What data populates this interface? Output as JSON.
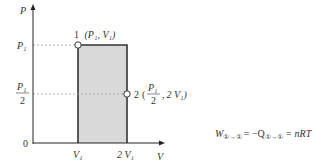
{
  "diagram": {
    "type": "pv-diagram",
    "axes": {
      "y_label": "P",
      "x_label": "V",
      "origin_label": "0",
      "y_ticks": [
        {
          "label": "P₁",
          "value": "P1"
        },
        {
          "label": "P₁/2",
          "numerator": "P₁",
          "denominator": "2",
          "value": "P1/2"
        }
      ],
      "x_ticks": [
        {
          "label": "V₁",
          "value": "V1"
        },
        {
          "label": "2 V₁",
          "value": "2V1"
        }
      ]
    },
    "points": [
      {
        "id": "1",
        "label": "1",
        "coords": "(P₁, V₁)",
        "P": "P1",
        "V": "V1"
      },
      {
        "id": "2",
        "label": "2",
        "coords_numerator": "P₁",
        "coords_denominator": "2",
        "coords_second": "2 V₁",
        "P": "P1/2",
        "V": "2V1"
      }
    ],
    "shaded_region": {
      "from_V": "V1",
      "to_V": "2V1",
      "from_P": "0",
      "to_P": "P1",
      "fill": "#d9d9d9"
    },
    "colors": {
      "axis": "#222222",
      "rect_stroke": "#333333",
      "dashed": "#999999",
      "fill": "#d9d9d9"
    }
  },
  "formula": {
    "lhs": "W",
    "lhs_sub": "①→①",
    "middle": "= −Q",
    "middle_sub": "①→①",
    "rhs": "= nRT",
    "full_text": "W(①→①) = −Q(①→①) = nRT"
  }
}
